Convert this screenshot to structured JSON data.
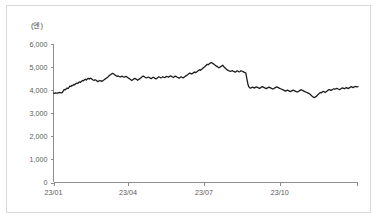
{
  "figure": {
    "unit_label": "(엔)",
    "background_color": "#ffffff",
    "border_color": "#d8d8d8",
    "line_color": "#1c1c1c",
    "axis_color": "#8e8e8e",
    "tick_text_color": "#5a5a5a"
  },
  "chart_data": {
    "type": "line",
    "title": "",
    "subtitle": "",
    "xlabel": "",
    "ylabel": "(엔)",
    "ylim": [
      0,
      6000
    ],
    "y_ticks": [
      0,
      1000,
      2000,
      3000,
      4000,
      5000,
      6000
    ],
    "y_tick_labels": [
      "0",
      "1,000",
      "2,000",
      "3,000",
      "4,000",
      "5,000",
      "6,000"
    ],
    "x_ticks": [
      "23/01",
      "23/04",
      "23/07",
      "23/10"
    ],
    "x_tick_labels": [
      "23/01",
      "23/04",
      "23/07",
      "23/10"
    ],
    "x_tick_positions": [
      0,
      0.245,
      0.494,
      0.743
    ],
    "xlim": [
      0,
      1
    ],
    "grid": false,
    "legend": null,
    "legend_position": "none",
    "series": [
      {
        "name": "엔 환율",
        "color": "#1c1c1c",
        "values": [
          3870,
          3865,
          3880,
          3875,
          3870,
          3885,
          3900,
          3890,
          3880,
          3895,
          3960,
          4030,
          4010,
          4055,
          4090,
          4070,
          4120,
          4180,
          4160,
          4210,
          4200,
          4250,
          4230,
          4280,
          4300,
          4290,
          4330,
          4360,
          4340,
          4390,
          4420,
          4400,
          4450,
          4470,
          4440,
          4490,
          4510,
          4480,
          4520,
          4500,
          4470,
          4440,
          4420,
          4450,
          4430,
          4400,
          4370,
          4395,
          4420,
          4400,
          4380,
          4410,
          4440,
          4470,
          4500,
          4530,
          4560,
          4600,
          4640,
          4670,
          4700,
          4730,
          4710,
          4680,
          4650,
          4620,
          4600,
          4615,
          4590,
          4570,
          4590,
          4610,
          4580,
          4560,
          4580,
          4600,
          4570,
          4540,
          4510,
          4480,
          4450,
          4420,
          4450,
          4480,
          4510,
          4490,
          4460,
          4430,
          4460,
          4490,
          4520,
          4560,
          4590,
          4610,
          4580,
          4550,
          4530,
          4550,
          4570,
          4550,
          4520,
          4500,
          4530,
          4560,
          4540,
          4510,
          4490,
          4520,
          4550,
          4580,
          4560,
          4530,
          4550,
          4580,
          4560,
          4540,
          4570,
          4600,
          4580,
          4560,
          4590,
          4620,
          4600,
          4570,
          4550,
          4580,
          4610,
          4590,
          4560,
          4540,
          4520,
          4550,
          4580,
          4560,
          4530,
          4560,
          4590,
          4620,
          4650,
          4680,
          4710,
          4740,
          4720,
          4700,
          4730,
          4760,
          4790,
          4760,
          4790,
          4820,
          4850,
          4880,
          4860,
          4900,
          4930,
          4970,
          5000,
          5040,
          5080,
          5120,
          5100,
          5140,
          5170,
          5200,
          5180,
          5150,
          5120,
          5090,
          5060,
          5030,
          5000,
          4970,
          4990,
          5020,
          5050,
          5080,
          5030,
          4980,
          4940,
          4900,
          4870,
          4850,
          4830,
          4810,
          4830,
          4850,
          4820,
          4800,
          4780,
          4810,
          4840,
          4820,
          4790,
          4810,
          4840,
          4820,
          4800,
          4780,
          4760,
          4740,
          4500,
          4280,
          4150,
          4100,
          4090,
          4110,
          4130,
          4110,
          4090,
          4120,
          4140,
          4120,
          4100,
          4080,
          4100,
          4130,
          4150,
          4130,
          4110,
          4090,
          4070,
          4090,
          4110,
          4130,
          4110,
          4090,
          4070,
          4050,
          4070,
          4100,
          4120,
          4140,
          4120,
          4100,
          4080,
          4060,
          4040,
          4020,
          4000,
          3980,
          3960,
          3980,
          4000,
          3980,
          3960,
          3940,
          3960,
          3980,
          4000,
          3980,
          3960,
          3940,
          3920,
          3940,
          3960,
          3990,
          4020,
          4000,
          3980,
          3960,
          3940,
          3920,
          3900,
          3880,
          3860,
          3840,
          3800,
          3760,
          3720,
          3690,
          3680,
          3710,
          3740,
          3780,
          3820,
          3860,
          3900,
          3880,
          3920,
          3950,
          3930,
          3900,
          3930,
          3960,
          4000,
          4030,
          4010,
          3990,
          4010,
          4040,
          4060,
          4040,
          4060,
          4080,
          4060,
          4040,
          4020,
          4050,
          4080,
          4100,
          4080,
          4060,
          4090,
          4110,
          4090,
          4070,
          4100,
          4130,
          4150,
          4130,
          4110,
          4140,
          4160,
          4150,
          4140,
          4150
        ]
      }
    ]
  }
}
